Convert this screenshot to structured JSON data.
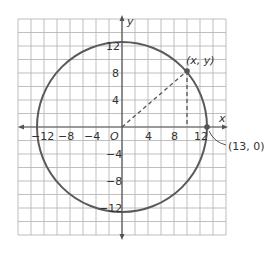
{
  "diagram": {
    "type": "coordinate-plane-circle",
    "colors": {
      "grid": "#b8b8b8",
      "axis": "#555555",
      "circle": "#5a5a5a",
      "dash": "#555555",
      "point": "#555555",
      "text": "#333333",
      "background": "#ffffff"
    },
    "axes": {
      "x_label": "x",
      "y_label": "y",
      "origin_label": "O",
      "x_ticks": [
        {
          "value": -12,
          "label": "−12"
        },
        {
          "value": -8,
          "label": "−8"
        },
        {
          "value": -4,
          "label": "−4"
        },
        {
          "value": 4,
          "label": "4"
        },
        {
          "value": 8,
          "label": "8"
        },
        {
          "value": 12,
          "label": "12"
        }
      ],
      "y_ticks": [
        {
          "value": 12,
          "label": "12"
        },
        {
          "value": 8,
          "label": "8"
        },
        {
          "value": 4,
          "label": "4"
        },
        {
          "value": -4,
          "label": "−4"
        },
        {
          "value": -8,
          "label": "−8"
        },
        {
          "value": -12,
          "label": "−12"
        }
      ],
      "range": [
        -16,
        16
      ],
      "grid_step": 2
    },
    "circle": {
      "center": [
        0,
        0
      ],
      "radius": 13
    },
    "points": [
      {
        "name": "general-point",
        "label": "(x, y)",
        "coords": [
          10,
          8.3
        ]
      },
      {
        "name": "intercept-point",
        "label": "(13, 0)",
        "coords": [
          13,
          0
        ]
      }
    ]
  }
}
